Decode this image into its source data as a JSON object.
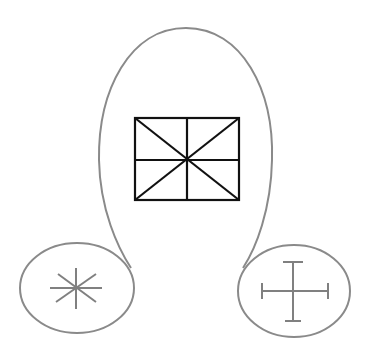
{
  "diagram": {
    "colors": {
      "background": "#ffffff",
      "outline": "#8a8a8a",
      "box": "#111111",
      "glyph": "#808080"
    },
    "shapes": {
      "balloon": {
        "top": [
          186,
          28
        ],
        "left_extent": 99,
        "right_extent": 272
      },
      "box": {
        "x": 135,
        "y": 118,
        "width": 104,
        "height": 82,
        "symbol": "square-with-cross-and-diagonals"
      },
      "left_ellipse": {
        "cx": 77,
        "cy": 288,
        "rx": 57,
        "ry": 45,
        "symbol": "asterisk-icon"
      },
      "right_ellipse": {
        "cx": 294,
        "cy": 291,
        "rx": 56,
        "ry": 46,
        "symbol": "capped-cross-icon"
      }
    }
  }
}
